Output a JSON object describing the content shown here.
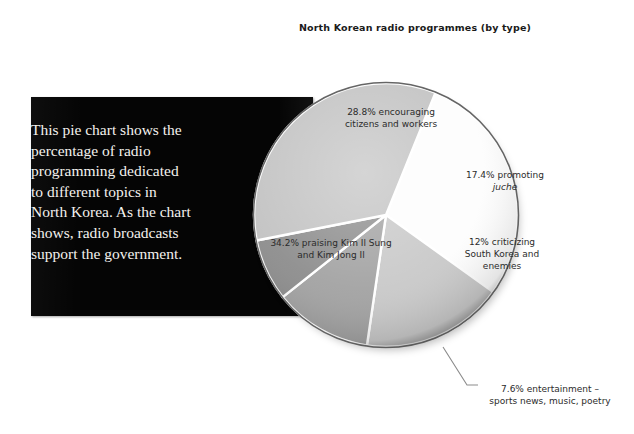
{
  "chart_data": {
    "type": "pie",
    "title": "North Korean radio programmes (by type)",
    "categories": [
      "encouraging citizens and workers",
      "promoting juche",
      "criticizing South Korea and enemies",
      "entertainment – sports news, music, poetry",
      "praising Kim Il Sung and Kim Jong Il"
    ],
    "values": [
      28.8,
      17.4,
      12,
      7.6,
      34.2
    ],
    "value_unit": "%",
    "legend": "none",
    "labels_placement": "inside-slices-with-one-callout",
    "slice_colors": [
      "#fdfdfd",
      "#c9c9c9",
      "#a3a3a3",
      "#8e8e8e",
      "#c3c3c3"
    ],
    "separator_color": "#ffffff",
    "slices": [
      {
        "label": "28.8% encouraging\ncitizens and workers",
        "value": 28.8,
        "color": "#fdfdfd",
        "label_mode": "inside"
      },
      {
        "label": "17.4% promoting",
        "emphasis": "juche",
        "value": 17.4,
        "color": "#c9c9c9",
        "label_mode": "inside"
      },
      {
        "label": "12% criticizing\nSouth Korea and\nenemies",
        "value": 12,
        "color": "#a3a3a3",
        "label_mode": "inside"
      },
      {
        "label": "7.6% entertainment –\nsports news, music, poetry",
        "value": 7.6,
        "color": "#8e8e8e",
        "label_mode": "callout"
      },
      {
        "label": "34.2% praising Kim Il Sung\nand Kim Jong Il",
        "value": 34.2,
        "color": "#c3c3c3",
        "label_mode": "inside"
      }
    ]
  },
  "caption": {
    "text": "This pie chart shows the percentage of radio programming dedicated to different topics in North Korea. As the chart shows, radio broadcasts support the government.",
    "background_color": "#050505",
    "text_color": "#f4f2ee"
  },
  "labels": {
    "encouraging": "28.8% encouraging\ncitizens and workers",
    "juche_prefix": "17.4% promoting",
    "juche_term": "juche",
    "criticizing": "12% criticizing\nSouth Korea and\nenemies",
    "praising": "34.2% praising Kim Il Sung\nand Kim Jong Il",
    "entertainment": "7.6% entertainment –\nsports news, music, poetry"
  }
}
